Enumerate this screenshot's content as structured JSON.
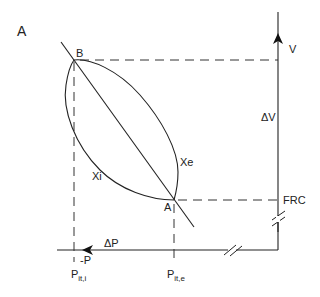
{
  "figure": {
    "panel_label": "A",
    "colors": {
      "line": "#222222",
      "dash": "#333333",
      "background": "#ffffff"
    }
  },
  "axes": {
    "vertical": {
      "label": "V",
      "delta_label": "ΔV",
      "baseline_label": "FRC"
    },
    "horizontal": {
      "label": "ΔP",
      "direction_label": "-P"
    }
  },
  "points": {
    "B": {
      "label": "B"
    },
    "A": {
      "label": "A"
    }
  },
  "curves": {
    "inspiratory": {
      "label": "Xi"
    },
    "expiratory": {
      "label": "Xe"
    }
  },
  "pressure_ticks": {
    "inspiratory": {
      "main": "P",
      "sub": "it,i"
    },
    "expiratory": {
      "main": "P",
      "sub": "it,e"
    }
  }
}
